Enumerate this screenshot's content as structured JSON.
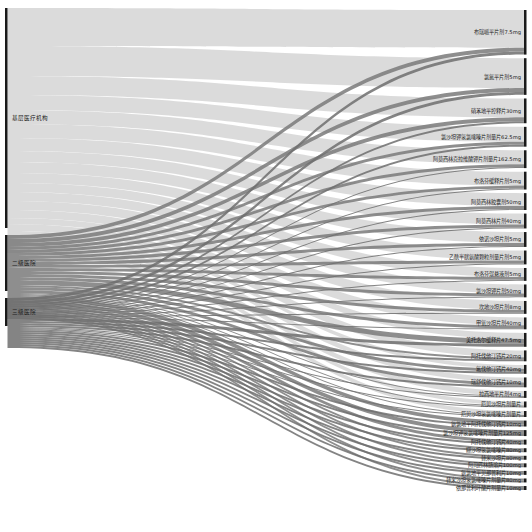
{
  "chart_data": {
    "type": "sankey",
    "title": "",
    "link_colors": {
      "基层医疗机构": "#d9d9d9",
      "二级医院": "#7a7a7a",
      "三级医院": "#6e6e6e"
    },
    "node_color": "#1a1a1a",
    "sources": [
      {
        "name": "基层医疗机构",
        "value": 440
      },
      {
        "name": "二级医院",
        "value": 112
      },
      {
        "name": "三级医院",
        "value": 56
      }
    ],
    "targets": [
      {
        "name": "布瑞哌平片剂7.5mg",
        "value": 90
      },
      {
        "name": "氯氮平片剂5mg",
        "value": 74
      },
      {
        "name": "硝苯地平控释片30mg",
        "value": 50
      },
      {
        "name": "氯沙坦钾氢氯噻嗪片剂量片62.5mg",
        "value": 40
      },
      {
        "name": "阿莫西林克拉维酸钾片剂量片162.5mg",
        "value": 36
      },
      {
        "name": "布洛芬缓释片剂5mg",
        "value": 36
      },
      {
        "name": "阿莫西林胶囊剂50mg",
        "value": 34
      },
      {
        "name": "阿莫西林片剂40mg",
        "value": 30
      },
      {
        "name": "依诺沙坦片剂5mg",
        "value": 30
      },
      {
        "name": "乙酰半胱氨酸颗粒剂量片剂5mg",
        "value": 28
      },
      {
        "name": "布洛芬混悬液剂5mg",
        "value": 26
      },
      {
        "name": "氯沙坦钾片剂50mg",
        "value": 26
      },
      {
        "name": "坎地沙坦片剂8mg",
        "value": 26
      },
      {
        "name": "甲氧沙坦片剂40mg",
        "value": 24
      },
      {
        "name": "美托洛尔缓释片47.5mg",
        "value": 28
      },
      {
        "name": "阿托伐他汀钙片20mg",
        "value": 22
      },
      {
        "name": "氟伐他汀钙片40mg",
        "value": 18
      },
      {
        "name": "瑞舒伐他汀钙片10mg",
        "value": 20
      },
      {
        "name": "拉西地平片剂4mg",
        "value": 14
      },
      {
        "name": "厄贝沙坦片剂量片",
        "value": 12
      },
      {
        "name": "厄贝沙坦氢氯噻嗪片剂量片",
        "value": 12
      },
      {
        "name": "氨氯地平阿托伐他汀钙片10mg",
        "value": 12
      },
      {
        "name": "氯沙坦钾氢氯噻嗪片剂量片125mg",
        "value": 12
      },
      {
        "name": "阿托伐他汀钙片40mg",
        "value": 10
      },
      {
        "name": "缬沙坦氢氯噻嗪片80mg",
        "value": 8
      },
      {
        "name": "替米沙坦片80mg",
        "value": 8
      },
      {
        "name": "阿司匹林肠溶片100mg",
        "value": 8
      },
      {
        "name": "氨氯地平贝那普利片10mg",
        "value": 8
      },
      {
        "name": "替米沙坦氢氯噻嗪片剂量片80mg",
        "value": 8
      },
      {
        "name": "依那普利叶酸片剂量片10mg",
        "value": 8
      }
    ],
    "links": [
      {
        "source": "基层医疗机构",
        "target": "布瑞哌平片剂7.5mg",
        "value": 76
      },
      {
        "source": "二级医院",
        "target": "布瑞哌平片剂7.5mg",
        "value": 8
      },
      {
        "source": "三级医院",
        "target": "布瑞哌平片剂7.5mg",
        "value": 6
      },
      {
        "source": "基层医疗机构",
        "target": "氯氮平片剂5mg",
        "value": 60
      },
      {
        "source": "二级医院",
        "target": "氯氮平片剂5mg",
        "value": 8
      },
      {
        "source": "三级医院",
        "target": "氯氮平片剂5mg",
        "value": 6
      },
      {
        "source": "基层医疗机构",
        "target": "硝苯地平控释片30mg",
        "value": 38
      },
      {
        "source": "二级医院",
        "target": "硝苯地平控释片30mg",
        "value": 8
      },
      {
        "source": "三级医院",
        "target": "硝苯地平控释片30mg",
        "value": 4
      },
      {
        "source": "基层医疗机构",
        "target": "氯沙坦钾氢氯噻嗪片剂量片62.5mg",
        "value": 30
      },
      {
        "source": "二级医院",
        "target": "氯沙坦钾氢氯噻嗪片剂量片62.5mg",
        "value": 6
      },
      {
        "source": "三级医院",
        "target": "氯沙坦钾氢氯噻嗪片剂量片62.5mg",
        "value": 4
      },
      {
        "source": "基层医疗机构",
        "target": "阿莫西林克拉维酸钾片剂量片162.5mg",
        "value": 28
      },
      {
        "source": "二级医院",
        "target": "阿莫西林克拉维酸钾片剂量片162.5mg",
        "value": 6
      },
      {
        "source": "三级医院",
        "target": "阿莫西林克拉维酸钾片剂量片162.5mg",
        "value": 2
      },
      {
        "source": "基层医疗机构",
        "target": "布洛芬缓释片剂5mg",
        "value": 28
      },
      {
        "source": "二级医院",
        "target": "布洛芬缓释片剂5mg",
        "value": 6
      },
      {
        "source": "三级医院",
        "target": "布洛芬缓释片剂5mg",
        "value": 2
      },
      {
        "source": "基层医疗机构",
        "target": "阿莫西林胶囊剂50mg",
        "value": 26
      },
      {
        "source": "二级医院",
        "target": "阿莫西林胶囊剂50mg",
        "value": 6
      },
      {
        "source": "三级医院",
        "target": "阿莫西林胶囊剂50mg",
        "value": 2
      },
      {
        "source": "基层医疗机构",
        "target": "阿莫西林片剂40mg",
        "value": 22
      },
      {
        "source": "二级医院",
        "target": "阿莫西林片剂40mg",
        "value": 6
      },
      {
        "source": "三级医院",
        "target": "阿莫西林片剂40mg",
        "value": 2
      },
      {
        "source": "基层医疗机构",
        "target": "依诺沙坦片剂5mg",
        "value": 22
      },
      {
        "source": "二级医院",
        "target": "依诺沙坦片剂5mg",
        "value": 6
      },
      {
        "source": "三级医院",
        "target": "依诺沙坦片剂5mg",
        "value": 2
      },
      {
        "source": "基层医疗机构",
        "target": "乙酰半胱氨酸颗粒剂量片剂5mg",
        "value": 20
      },
      {
        "source": "二级医院",
        "target": "乙酰半胱氨酸颗粒剂量片剂5mg",
        "value": 6
      },
      {
        "source": "三级医院",
        "target": "乙酰半胱氨酸颗粒剂量片剂5mg",
        "value": 2
      },
      {
        "source": "基层医疗机构",
        "target": "布洛芬混悬液剂5mg",
        "value": 18
      },
      {
        "source": "二级医院",
        "target": "布洛芬混悬液剂5mg",
        "value": 6
      },
      {
        "source": "三级医院",
        "target": "布洛芬混悬液剂5mg",
        "value": 2
      },
      {
        "source": "基层医疗机构",
        "target": "氯沙坦钾片剂50mg",
        "value": 18
      },
      {
        "source": "二级医院",
        "target": "氯沙坦钾片剂50mg",
        "value": 6
      },
      {
        "source": "三级医院",
        "target": "氯沙坦钾片剂50mg",
        "value": 2
      },
      {
        "source": "基层医疗机构",
        "target": "坎地沙坦片剂8mg",
        "value": 18
      },
      {
        "source": "二级医院",
        "target": "坎地沙坦片剂8mg",
        "value": 6
      },
      {
        "source": "三级医院",
        "target": "坎地沙坦片剂8mg",
        "value": 2
      },
      {
        "source": "基层医疗机构",
        "target": "甲氧沙坦片剂40mg",
        "value": 16
      },
      {
        "source": "二级医院",
        "target": "甲氧沙坦片剂40mg",
        "value": 6
      },
      {
        "source": "三级医院",
        "target": "甲氧沙坦片剂40mg",
        "value": 2
      },
      {
        "source": "基层医疗机构",
        "target": "美托洛尔缓释片47.5mg",
        "value": 12
      },
      {
        "source": "二级医院",
        "target": "美托洛尔缓释片47.5mg",
        "value": 10
      },
      {
        "source": "三级医院",
        "target": "美托洛尔缓释片47.5mg",
        "value": 6
      },
      {
        "source": "基层医疗机构",
        "target": "阿托伐他汀钙片20mg",
        "value": 14
      },
      {
        "source": "二级医院",
        "target": "阿托伐他汀钙片20mg",
        "value": 4
      },
      {
        "source": "三级医院",
        "target": "阿托伐他汀钙片20mg",
        "value": 4
      },
      {
        "source": "基层医疗机构",
        "target": "氟伐他汀钙片40mg",
        "value": 8
      },
      {
        "source": "二级医院",
        "target": "氟伐他汀钙片40mg",
        "value": 6
      },
      {
        "source": "三级医院",
        "target": "氟伐他汀钙片40mg",
        "value": 4
      },
      {
        "source": "基层医疗机构",
        "target": "瑞舒伐他汀钙片10mg",
        "value": 10
      },
      {
        "source": "二级医院",
        "target": "瑞舒伐他汀钙片10mg",
        "value": 6
      },
      {
        "source": "三级医院",
        "target": "瑞舒伐他汀钙片10mg",
        "value": 4
      },
      {
        "source": "基层医疗机构",
        "target": "拉西地平片剂4mg",
        "value": 10
      },
      {
        "source": "二级医院",
        "target": "拉西地平片剂4mg",
        "value": 2
      },
      {
        "source": "三级医院",
        "target": "拉西地平片剂4mg",
        "value": 2
      },
      {
        "source": "基层医疗机构",
        "target": "厄贝沙坦片剂量片",
        "value": 8
      },
      {
        "source": "二级医院",
        "target": "厄贝沙坦片剂量片",
        "value": 2
      },
      {
        "source": "三级医院",
        "target": "厄贝沙坦片剂量片",
        "value": 2
      },
      {
        "source": "基层医疗机构",
        "target": "厄贝沙坦氢氯噻嗪片剂量片",
        "value": 8
      },
      {
        "source": "二级医院",
        "target": "厄贝沙坦氢氯噻嗪片剂量片",
        "value": 2
      },
      {
        "source": "三级医院",
        "target": "厄贝沙坦氢氯噻嗪片剂量片",
        "value": 2
      },
      {
        "source": "二级医院",
        "target": "氨氯地平阿托伐他汀钙片10mg",
        "value": 8
      },
      {
        "source": "三级医院",
        "target": "氨氯地平阿托伐他汀钙片10mg",
        "value": 4
      },
      {
        "source": "二级医院",
        "target": "氯沙坦钾氢氯噻嗪片剂量片125mg",
        "value": 8
      },
      {
        "source": "三级医院",
        "target": "氯沙坦钾氢氯噻嗪片剂量片125mg",
        "value": 4
      },
      {
        "source": "二级医院",
        "target": "阿托伐他汀钙片40mg",
        "value": 6
      },
      {
        "source": "三级医院",
        "target": "阿托伐他汀钙片40mg",
        "value": 4
      },
      {
        "source": "二级医院",
        "target": "缬沙坦氢氯噻嗪片80mg",
        "value": 4
      },
      {
        "source": "三级医院",
        "target": "缬沙坦氢氯噻嗪片80mg",
        "value": 4
      },
      {
        "source": "二级医院",
        "target": "替米沙坦片80mg",
        "value": 4
      },
      {
        "source": "三级医院",
        "target": "替米沙坦片80mg",
        "value": 4
      },
      {
        "source": "二级医院",
        "target": "阿司匹林肠溶片100mg",
        "value": 4
      },
      {
        "source": "三级医院",
        "target": "阿司匹林肠溶片100mg",
        "value": 4
      },
      {
        "source": "二级医院",
        "target": "氨氯地平贝那普利片10mg",
        "value": 4
      },
      {
        "source": "三级医院",
        "target": "氨氯地平贝那普利片10mg",
        "value": 4
      },
      {
        "source": "二级医院",
        "target": "替米沙坦氢氯噻嗪片剂量片80mg",
        "value": 4
      },
      {
        "source": "三级医院",
        "target": "替米沙坦氢氯噻嗪片剂量片80mg",
        "value": 4
      },
      {
        "source": "二级医院",
        "target": "依那普利叶酸片剂量片10mg",
        "value": 4
      },
      {
        "source": "三级医院",
        "target": "依那普利叶酸片剂量片10mg",
        "value": 4
      }
    ]
  }
}
